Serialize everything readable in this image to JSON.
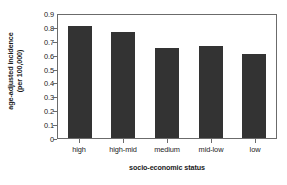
{
  "chart_data": {
    "type": "bar",
    "title": "",
    "categories": [
      "high",
      "high-mid",
      "medium",
      "mid-low",
      "low"
    ],
    "values": [
      0.81,
      0.76,
      0.645,
      0.66,
      0.605
    ],
    "xlabel": "socio-economic status",
    "ylabel_line1": "age-adjusted incidence",
    "ylabel_line2": "(per 100,000)",
    "ylim": [
      0,
      0.9
    ],
    "ytick_labels": [
      "0.9",
      "0.8",
      "0.7",
      "0.6",
      "0.5",
      "0.4",
      "0.3",
      "0.2",
      "0.1",
      "0"
    ],
    "ytick_values": [
      0.9,
      0.8,
      0.7,
      0.6,
      0.5,
      0.4,
      0.3,
      0.2,
      0.1,
      0
    ],
    "grid": false,
    "legend": false,
    "bar_color": "#333333",
    "frame_color": "#6b6b6b",
    "background_color": "#ffffff"
  }
}
